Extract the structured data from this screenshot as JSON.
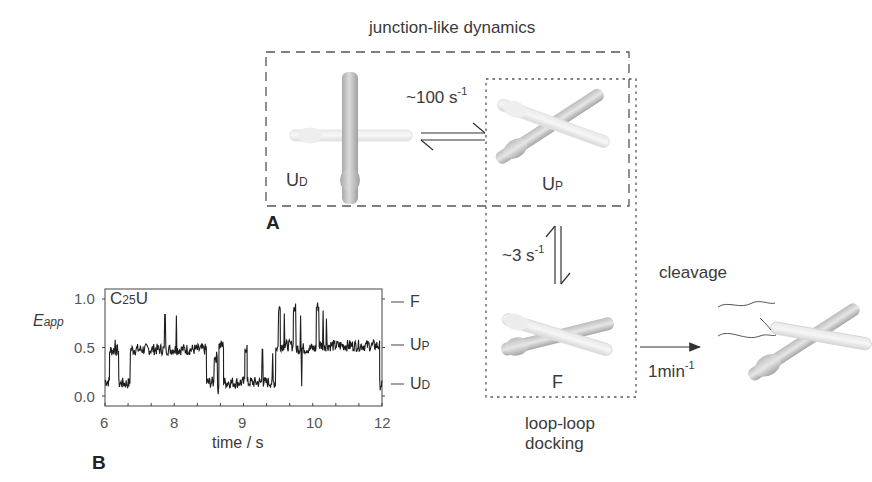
{
  "panel_a": {
    "label": "A",
    "title_top": "junction-like dynamics",
    "title_bottom_line1": "loop-loop",
    "title_bottom_line2": "docking",
    "states": {
      "ud": {
        "main": "U",
        "sub": "D"
      },
      "up": {
        "main": "U",
        "sub": "P"
      },
      "f": {
        "main": "F"
      }
    },
    "rates": {
      "ud_up": {
        "base": "~100 s",
        "exp": "-1"
      },
      "up_f": {
        "base": "~3 s",
        "exp": "-1"
      },
      "cleavage": {
        "base": "1min",
        "exp": "-1"
      }
    },
    "cleavage_label": "cleavage",
    "colors": {
      "line": "#444444",
      "molecule": "#d9d9d9",
      "molecule_dark": "#a8a8a8"
    }
  },
  "panel_b": {
    "label": "B",
    "inset_title": {
      "main": "C",
      "sub": "25",
      "tail": "U"
    },
    "ylabel": {
      "main": "E",
      "sub": "app"
    },
    "xlabel": "time / s",
    "ytick_labels": [
      "1.0",
      "0.5",
      "0.0"
    ],
    "xtick_labels": [
      "6",
      "8",
      "9",
      "10",
      "12"
    ],
    "state_markers": [
      {
        "main": "F",
        "sub": ""
      },
      {
        "main": "U",
        "sub": "P"
      },
      {
        "main": "U",
        "sub": "D"
      }
    ]
  },
  "chart_data": {
    "type": "line",
    "title": "C25U",
    "xlabel": "time / s",
    "ylabel": "E_app",
    "xlim": [
      6,
      12
    ],
    "ylim": [
      -0.1,
      1.1
    ],
    "xtick_labels": [
      "6",
      "8",
      "9",
      "10",
      "12"
    ],
    "yticks": [
      0.0,
      0.5,
      1.0
    ],
    "grid": false,
    "state_levels": {
      "F": 0.95,
      "U_P": 0.5,
      "U_D": 0.12
    },
    "segments": [
      {
        "t0": 6.0,
        "t1": 6.1,
        "level": 0.15
      },
      {
        "t0": 6.1,
        "t1": 6.3,
        "level": 0.47
      },
      {
        "t0": 6.3,
        "t1": 6.55,
        "level": 0.13
      },
      {
        "t0": 6.55,
        "t1": 8.2,
        "level": 0.48
      },
      {
        "t0": 8.2,
        "t1": 8.37,
        "level": 0.14
      },
      {
        "t0": 8.37,
        "t1": 8.44,
        "level": 0.4
      },
      {
        "t0": 8.44,
        "t1": 8.47,
        "level": 0.15
      },
      {
        "t0": 8.47,
        "t1": 8.57,
        "level": 0.52
      },
      {
        "t0": 8.57,
        "t1": 9.03,
        "level": 0.14
      },
      {
        "t0": 9.03,
        "t1": 9.08,
        "level": 0.5
      },
      {
        "t0": 9.08,
        "t1": 9.7,
        "level": 0.14
      },
      {
        "t0": 9.7,
        "t1": 9.76,
        "level": 0.5
      },
      {
        "t0": 9.76,
        "t1": 9.8,
        "level": 0.9
      },
      {
        "t0": 9.8,
        "t1": 10.08,
        "level": 0.52
      },
      {
        "t0": 10.08,
        "t1": 10.14,
        "level": 0.9
      },
      {
        "t0": 10.14,
        "t1": 10.58,
        "level": 0.49
      },
      {
        "t0": 10.58,
        "t1": 10.64,
        "level": 0.92
      },
      {
        "t0": 10.64,
        "t1": 11.95,
        "level": 0.52
      },
      {
        "t0": 11.95,
        "t1": 12.0,
        "level": 0.12
      }
    ],
    "spikes": [
      {
        "t": 6.22,
        "value": 0.58
      },
      {
        "t": 7.3,
        "value": 0.84
      },
      {
        "t": 7.55,
        "value": 0.83
      },
      {
        "t": 8.37,
        "value": 0.38
      },
      {
        "t": 8.45,
        "value": 0.02
      },
      {
        "t": 9.41,
        "value": 0.48
      },
      {
        "t": 9.63,
        "value": 0.44
      },
      {
        "t": 9.88,
        "value": 0.85
      },
      {
        "t": 10.24,
        "value": 0.83
      },
      {
        "t": 10.26,
        "value": 0.1
      },
      {
        "t": 10.72,
        "value": 0.88
      },
      {
        "t": 10.8,
        "value": 0.8
      }
    ]
  }
}
